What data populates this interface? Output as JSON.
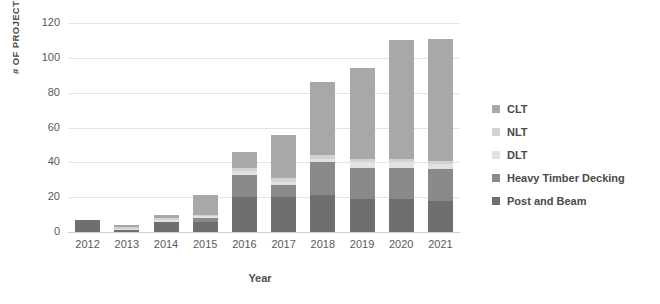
{
  "chart_data": {
    "type": "bar",
    "stacked": true,
    "title": "",
    "xlabel": "Year",
    "ylabel": "# OF PROJECTS",
    "categories": [
      "2012",
      "2013",
      "2014",
      "2015",
      "2016",
      "2017",
      "2018",
      "2019",
      "2020",
      "2021"
    ],
    "ylim": [
      0,
      120
    ],
    "yticks": [
      0,
      20,
      40,
      60,
      80,
      100,
      120
    ],
    "grid": true,
    "legend_position": "right",
    "series": [
      {
        "name": "Post and Beam",
        "color": "#6f6f6f",
        "values": [
          7,
          1,
          6,
          6,
          20,
          20,
          21,
          19,
          19,
          18
        ]
      },
      {
        "name": "Heavy Timber Decking",
        "color": "#8a8a8a",
        "values": [
          0,
          0,
          0,
          2,
          13,
          7,
          19,
          18,
          18,
          18
        ]
      },
      {
        "name": "DLT",
        "color": "#e2e2e2",
        "values": [
          0,
          1,
          1,
          1,
          2,
          2,
          2,
          3,
          3,
          3
        ]
      },
      {
        "name": "NLT",
        "color": "#d2d2d2",
        "values": [
          0,
          1,
          1,
          1,
          2,
          2,
          2,
          2,
          2,
          2
        ]
      },
      {
        "name": "CLT",
        "color": "#a8a8a8",
        "values": [
          0,
          1,
          2,
          11,
          9,
          25,
          42,
          52,
          68,
          70
        ]
      }
    ],
    "totals": [
      7,
      3,
      10,
      21,
      46,
      56,
      86,
      94,
      110,
      111
    ]
  },
  "legend": {
    "items": [
      {
        "label": "CLT",
        "color": "#a8a8a8"
      },
      {
        "label": "NLT",
        "color": "#d2d2d2"
      },
      {
        "label": "DLT",
        "color": "#e2e2e2"
      },
      {
        "label": "Heavy Timber Decking",
        "color": "#8a8a8a"
      },
      {
        "label": "Post and Beam",
        "color": "#6f6f6f"
      }
    ]
  }
}
